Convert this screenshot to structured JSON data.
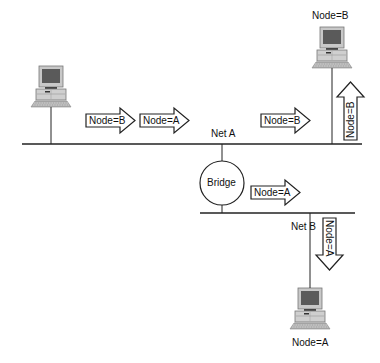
{
  "diagram": {
    "networks": [
      {
        "id": "net-a",
        "label": "Net A"
      },
      {
        "id": "net-b",
        "label": "Net B"
      }
    ],
    "bridge": {
      "label": "Bridge"
    },
    "hosts": [
      {
        "id": "left-host",
        "label": ""
      },
      {
        "id": "host-b",
        "label": "Node=B"
      },
      {
        "id": "host-a",
        "label": "Node=A"
      }
    ],
    "frames": [
      {
        "id": "frame-1",
        "label": "Node=B",
        "direction": "right",
        "network": "Net A"
      },
      {
        "id": "frame-2",
        "label": "Node=A",
        "direction": "right",
        "network": "Net A"
      },
      {
        "id": "frame-3",
        "label": "Node=B",
        "direction": "right",
        "network": "Net A"
      },
      {
        "id": "frame-4",
        "label": "Node=B",
        "direction": "up",
        "network": "Net A"
      },
      {
        "id": "frame-5",
        "label": "Node=A",
        "direction": "right",
        "network": "Net B"
      },
      {
        "id": "frame-6",
        "label": "Node=A",
        "direction": "down",
        "network": "Net B"
      }
    ],
    "colors": {
      "line": "#222222",
      "monitor_body": "#bdbdbd",
      "screen": "#5a5a5a",
      "arrow_fill": "#ffffff"
    }
  }
}
